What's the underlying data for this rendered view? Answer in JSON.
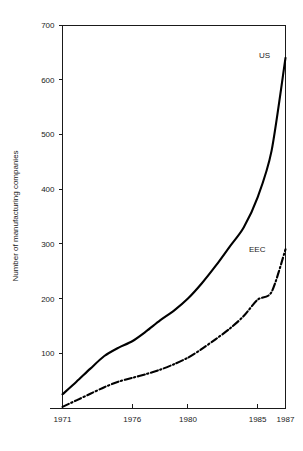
{
  "chart_data": {
    "type": "line",
    "title": "",
    "xlabel": "",
    "ylabel": "Number of manufacturing companies",
    "xlim": [
      1971,
      1987
    ],
    "ylim": [
      0,
      700
    ],
    "grid": false,
    "legend": "inline-end-of-line-labels",
    "x_ticks": [
      1971,
      1976,
      1980,
      1985,
      1987
    ],
    "x_tick_labels": [
      "1971",
      "1976",
      "1980",
      "1985",
      "1987"
    ],
    "y_ticks": [
      100,
      200,
      300,
      400,
      500,
      600,
      700
    ],
    "y_tick_labels": [
      "100",
      "200",
      "300",
      "400",
      "500",
      "600",
      "700"
    ],
    "series": [
      {
        "name": "US",
        "label": "US",
        "style": "solid",
        "color": "#000000",
        "x": [
          1971,
          1972,
          1973,
          1974,
          1975,
          1976,
          1977,
          1978,
          1979,
          1980,
          1981,
          1982,
          1983,
          1984,
          1985,
          1986,
          1987
        ],
        "values": [
          25,
          48,
          72,
          95,
          110,
          122,
          140,
          160,
          178,
          200,
          228,
          260,
          295,
          330,
          385,
          470,
          640
        ]
      },
      {
        "name": "EEC",
        "label": "EEC",
        "style": "dash-dot",
        "color": "#000000",
        "x": [
          1971,
          1972,
          1973,
          1974,
          1975,
          1976,
          1977,
          1978,
          1979,
          1980,
          1981,
          1982,
          1983,
          1984,
          1985,
          1986,
          1987
        ],
        "values": [
          2,
          14,
          26,
          38,
          48,
          55,
          62,
          70,
          80,
          92,
          108,
          126,
          145,
          168,
          198,
          212,
          290
        ]
      }
    ],
    "annotations": [
      {
        "text": "US",
        "x": 1986.2,
        "y": 667
      },
      {
        "text": "EEC",
        "x": 1985.3,
        "y": 292
      }
    ]
  }
}
